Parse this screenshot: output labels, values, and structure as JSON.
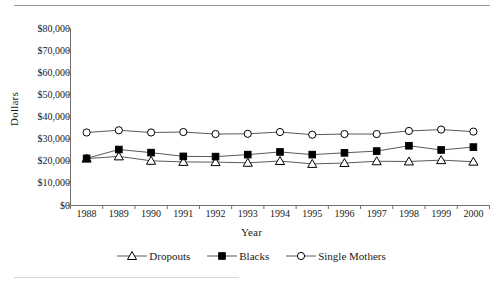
{
  "chart_data": {
    "type": "line",
    "title": "",
    "xlabel": "Year",
    "ylabel": "Dollars",
    "categories": [
      "1988",
      "1989",
      "1990",
      "1991",
      "1992",
      "1993",
      "1994",
      "1995",
      "1996",
      "1997",
      "1998",
      "1999",
      "2000"
    ],
    "ylim": [
      0,
      80000
    ],
    "ytick_labels": [
      "$0",
      "$10,000",
      "$20,000",
      "$30,000",
      "$40,000",
      "$50,000",
      "$60,000",
      "$70,000",
      "$80,000"
    ],
    "ytick_values": [
      0,
      10000,
      20000,
      30000,
      40000,
      50000,
      60000,
      70000,
      80000
    ],
    "grid": false,
    "legend_position": "bottom",
    "series": [
      {
        "name": "Dropouts",
        "marker": "open-triangle",
        "color": "#000000",
        "values": [
          21200,
          22200,
          20200,
          19700,
          19600,
          19300,
          20100,
          18800,
          19200,
          20000,
          19900,
          20500,
          19800
        ]
      },
      {
        "name": "Blacks",
        "marker": "filled-square",
        "color": "#000000",
        "values": [
          21300,
          25300,
          23900,
          22200,
          22100,
          23000,
          24200,
          23000,
          23800,
          24600,
          27000,
          25100,
          26400
        ]
      },
      {
        "name": "Single Mothers",
        "marker": "open-circle",
        "color": "#000000",
        "values": [
          33000,
          34000,
          33000,
          33200,
          32300,
          32400,
          33200,
          32000,
          32300,
          32300,
          33700,
          34300,
          33400
        ]
      }
    ]
  },
  "legend": {
    "items": [
      {
        "label": "Dropouts",
        "marker": "open-triangle"
      },
      {
        "label": "Blacks",
        "marker": "filled-square"
      },
      {
        "label": "Single Mothers",
        "marker": "open-circle"
      }
    ]
  },
  "axes": {
    "y_title": "Dollars",
    "x_title": "Year"
  },
  "colors": {
    "axis": "#6f6f6f",
    "line": "#5a5a5a",
    "marker_stroke": "#000000",
    "marker_fill_open": "#ffffff",
    "marker_fill_solid": "#000000",
    "rule": "#9a9a9a"
  }
}
